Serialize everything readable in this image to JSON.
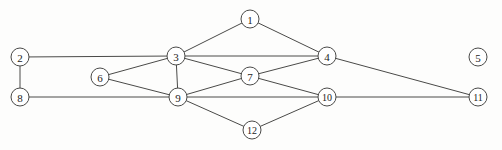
{
  "figure": {
    "background_color": "#fdfdfc",
    "stroke_color": "#4a4a48",
    "label_color": "#1d1d1b",
    "node_fill": "#ffffff"
  },
  "chart_data": {
    "type": "diagram",
    "node_radius": 9,
    "nodes": [
      {
        "id": "1",
        "label": "1",
        "x": 250,
        "y": 19,
        "degree": 2
      },
      {
        "id": "2",
        "label": "2",
        "x": 20,
        "y": 57,
        "degree": 2
      },
      {
        "id": "3",
        "label": "3",
        "x": 176,
        "y": 56,
        "degree": 6
      },
      {
        "id": "4",
        "label": "4",
        "x": 327,
        "y": 56,
        "degree": 4
      },
      {
        "id": "5",
        "label": "5",
        "x": 478,
        "y": 57,
        "degree": 0
      },
      {
        "id": "6",
        "label": "6",
        "x": 100,
        "y": 77,
        "degree": 2
      },
      {
        "id": "7",
        "label": "7",
        "x": 250,
        "y": 76,
        "degree": 4
      },
      {
        "id": "8",
        "label": "8",
        "x": 20,
        "y": 97,
        "degree": 2
      },
      {
        "id": "9",
        "label": "9",
        "x": 178,
        "y": 97,
        "degree": 6
      },
      {
        "id": "10",
        "label": "10",
        "x": 327,
        "y": 97,
        "degree": 4
      },
      {
        "id": "11",
        "label": "11",
        "x": 478,
        "y": 97,
        "degree": 2
      },
      {
        "id": "12",
        "label": "12",
        "x": 252,
        "y": 130,
        "degree": 2
      }
    ],
    "edges": [
      {
        "source": "1",
        "target": "3"
      },
      {
        "source": "1",
        "target": "4"
      },
      {
        "source": "2",
        "target": "3"
      },
      {
        "source": "2",
        "target": "8"
      },
      {
        "source": "3",
        "target": "4"
      },
      {
        "source": "3",
        "target": "6"
      },
      {
        "source": "3",
        "target": "7"
      },
      {
        "source": "3",
        "target": "9"
      },
      {
        "source": "4",
        "target": "7"
      },
      {
        "source": "4",
        "target": "11"
      },
      {
        "source": "6",
        "target": "9"
      },
      {
        "source": "7",
        "target": "9"
      },
      {
        "source": "7",
        "target": "10"
      },
      {
        "source": "8",
        "target": "9"
      },
      {
        "source": "9",
        "target": "10"
      },
      {
        "source": "9",
        "target": "12"
      },
      {
        "source": "10",
        "target": "11"
      },
      {
        "source": "10",
        "target": "12"
      }
    ],
    "isolated_nodes": [
      "5"
    ],
    "node_count": 12,
    "edge_count": 18
  }
}
